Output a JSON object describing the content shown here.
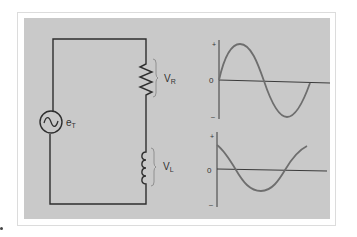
{
  "figure": {
    "type": "series RL circuit with voltage waveforms",
    "colors": {
      "panel": "#c9c9c9",
      "wire": "#2e2e2e",
      "waveform": "#6e6e6e",
      "axis": "#3a3a3a",
      "brace": "#8a8a8a",
      "frame": "#dcdcdc"
    }
  },
  "circuit": {
    "source": {
      "symbol": "~",
      "label_main": "e",
      "label_sub": "T"
    },
    "resistor": {
      "label_main": "V",
      "label_sub": "R"
    },
    "inductor": {
      "label_main": "V",
      "label_sub": "L"
    }
  },
  "graphs": {
    "top": {
      "plus_label": "+",
      "zero_label": "0",
      "minus_label": "–",
      "waveform": "sine",
      "represents": "VR"
    },
    "bottom": {
      "plus_label": "+",
      "zero_label": "0",
      "minus_label": "–",
      "waveform": "cosine",
      "represents": "VL"
    }
  }
}
